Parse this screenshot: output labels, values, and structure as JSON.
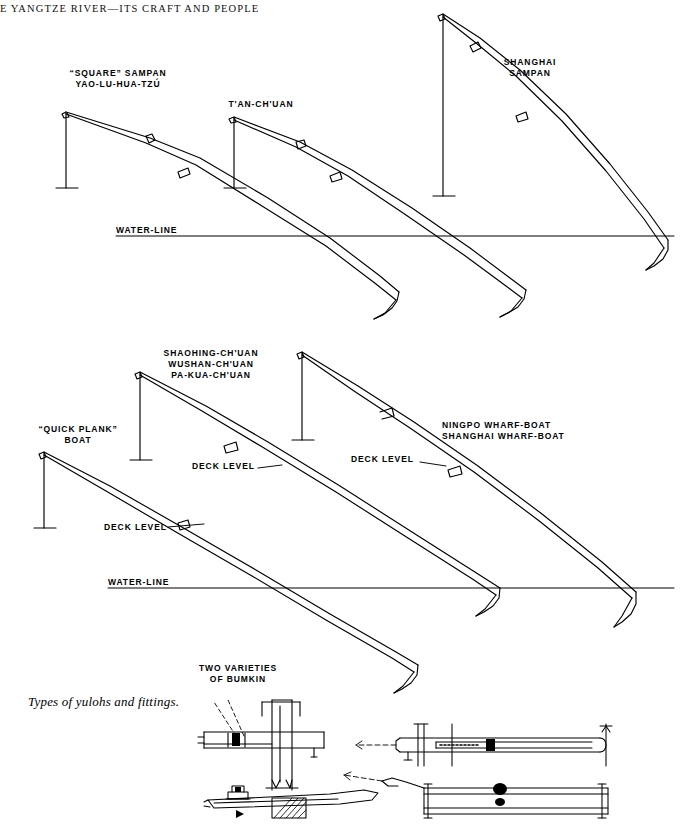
{
  "page": {
    "running_head": "E YANGTZE RIVER—ITS CRAFT AND PEOPLE",
    "caption": "Types of yulohs and fittings.",
    "width": 682,
    "height": 826,
    "ink_color": "#000000",
    "background_color": "#ffffff"
  },
  "labels": {
    "square_sampan_l1": "“SQUARE” SAMPAN",
    "square_sampan_l2": "YAO-LU-HUA-TZÚ",
    "tan_chuan": "T'AN-CH'UAN",
    "shanghai_sampan_l1": "SHANGHAI",
    "shanghai_sampan_l2": "SAMPAN",
    "water_line_top": "WATER-LINE",
    "water_line_mid": "WATER-LINE",
    "quick_plank_l1": "“QUICK PLANK”",
    "quick_plank_l2": "BOAT",
    "shaohing_l1": "SHAOHING-CH'UAN",
    "shaohing_l2": "WUSHAN-CH'UAN",
    "shaohing_l3": "PA-KUA-CH'UAN",
    "wharf_l1": "NINGPO WHARF-BOAT",
    "wharf_l2": "SHANGHAI WHARF-BOAT",
    "deck_level_1": "DECK LEVEL",
    "deck_level_2": "DECK LEVEL",
    "deck_level_3": "DECK LEVEL",
    "bumkin_l1": "TWO VARIETIES",
    "bumkin_l2": "OF BUMKIN"
  },
  "diagram": {
    "type": "technical-line-drawing",
    "rows": [
      {
        "name": "upper-row",
        "water_line_y": 236,
        "craft": [
          "“SQUARE” SAMPAN YAO-LU-HUA-TZÚ",
          "T'AN-CH'UAN",
          "SHANGHAI SAMPAN"
        ]
      },
      {
        "name": "middle-row",
        "water_line_y": 588,
        "craft": [
          "“QUICK PLANK” BOAT",
          "SHAOHING-CH'UAN WUSHAN-CH'UAN PA-KUA-CH'UAN",
          "NINGPO / SHANGHAI WHARF-BOAT"
        ]
      },
      {
        "name": "lower-row",
        "craft": [
          "TWO VARIETIES OF BUMKIN"
        ]
      }
    ]
  }
}
